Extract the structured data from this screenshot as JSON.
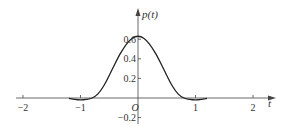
{
  "chart_data": {
    "type": "line",
    "title": "",
    "xlabel": "t",
    "ylabel": "p(t)",
    "origin_label": "O",
    "xlim": [
      -2.1,
      2.35
    ],
    "ylim": [
      -0.25,
      0.7
    ],
    "x_ticks": [
      -2,
      -1,
      1,
      2
    ],
    "x_tick_labels": [
      "-2",
      "-1",
      "1",
      "2"
    ],
    "y_ticks": [
      0.6,
      0.4,
      0.2,
      -0.2
    ],
    "y_tick_labels": [
      "0.6",
      "0.4",
      "0.2",
      "-0.2"
    ],
    "grid": false,
    "legend": null,
    "series": [
      {
        "name": "p(t)",
        "x": [
          -1.2,
          -1.1,
          -1.0,
          -0.9,
          -0.8,
          -0.7,
          -0.6,
          -0.5,
          -0.4,
          -0.3,
          -0.2,
          -0.1,
          0.0,
          0.1,
          0.2,
          0.3,
          0.4,
          0.5,
          0.6,
          0.7,
          0.8,
          0.9,
          1.0,
          1.1,
          1.2
        ],
        "y": [
          -0.003,
          -0.015,
          -0.02,
          -0.015,
          0.0,
          0.04,
          0.12,
          0.23,
          0.35,
          0.46,
          0.55,
          0.61,
          0.63,
          0.61,
          0.55,
          0.46,
          0.35,
          0.23,
          0.12,
          0.04,
          0.0,
          -0.015,
          -0.02,
          -0.015,
          -0.003
        ]
      }
    ],
    "colors": {
      "axis": "#444444",
      "curve": "#222222",
      "text": "#333333"
    }
  }
}
